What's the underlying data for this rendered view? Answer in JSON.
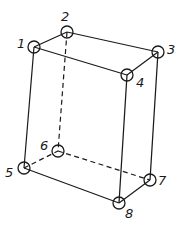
{
  "diagram": {
    "type": "wireframe-box",
    "nodes": [
      {
        "id": "1",
        "label": "1"
      },
      {
        "id": "2",
        "label": "2"
      },
      {
        "id": "3",
        "label": "3"
      },
      {
        "id": "4",
        "label": "4"
      },
      {
        "id": "5",
        "label": "5"
      },
      {
        "id": "6",
        "label": "6"
      },
      {
        "id": "7",
        "label": "7"
      },
      {
        "id": "8",
        "label": "8"
      }
    ],
    "edges": [
      {
        "from": "1",
        "to": "2",
        "style": "solid"
      },
      {
        "from": "1",
        "to": "4",
        "style": "solid"
      },
      {
        "from": "2",
        "to": "3",
        "style": "solid"
      },
      {
        "from": "3",
        "to": "4",
        "style": "solid"
      },
      {
        "from": "1",
        "to": "5",
        "style": "solid"
      },
      {
        "from": "4",
        "to": "8",
        "style": "solid"
      },
      {
        "from": "3",
        "to": "7",
        "style": "solid"
      },
      {
        "from": "5",
        "to": "8",
        "style": "solid"
      },
      {
        "from": "7",
        "to": "8",
        "style": "solid"
      },
      {
        "from": "2",
        "to": "6",
        "style": "dashed"
      },
      {
        "from": "5",
        "to": "6",
        "style": "dashed"
      },
      {
        "from": "6",
        "to": "7",
        "style": "dashed"
      }
    ],
    "colors": {
      "stroke": "#1a1a1a",
      "background": "#ffffff"
    }
  }
}
